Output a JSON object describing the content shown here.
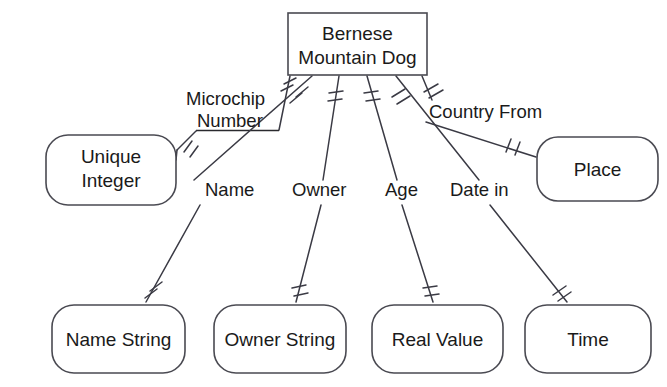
{
  "diagram": {
    "notation": "crow's-foot / Barker ER",
    "background_color": "#ffffff",
    "line_color": "#3a3a44",
    "box_stroke_color": "#4a4a52",
    "text_color": "#1a1a1a"
  },
  "entity": {
    "name": "entity-bernese",
    "line1": "Bernese",
    "line2": "Mountain Dog",
    "shape": "rectangle",
    "x": 288,
    "y": 13,
    "width": 139,
    "height": 62
  },
  "value_boxes": [
    {
      "name": "unique-integer",
      "line1": "Unique",
      "line2": "Integer",
      "shape": "rounded-rectangle",
      "x": 46,
      "y": 135,
      "width": 130,
      "height": 70
    },
    {
      "name": "place",
      "line1": "Place",
      "line2": "",
      "shape": "rounded-rectangle",
      "x": 537,
      "y": 137,
      "width": 121,
      "height": 64
    },
    {
      "name": "name-string",
      "line1": "Name String",
      "line2": "",
      "shape": "rounded-rectangle",
      "x": 52,
      "y": 305,
      "width": 133,
      "height": 68
    },
    {
      "name": "owner-string",
      "line1": "Owner String",
      "line2": "",
      "shape": "rounded-rectangle",
      "x": 214,
      "y": 305,
      "width": 132,
      "height": 68
    },
    {
      "name": "real-value",
      "line1": "Real Value",
      "line2": "",
      "shape": "rounded-rectangle",
      "x": 372,
      "y": 305,
      "width": 131,
      "height": 68
    },
    {
      "name": "time",
      "line1": "Time",
      "line2": "",
      "shape": "rounded-rectangle",
      "x": 525,
      "y": 305,
      "width": 126,
      "height": 68
    }
  ],
  "relationships": [
    {
      "name": "microchip-number",
      "label_line1": "Microchip",
      "label_line2": "Number",
      "underlined": true,
      "from": "entity-bernese",
      "to": "unique-integer"
    },
    {
      "name": "name",
      "label_line1": "Name",
      "label_line2": "",
      "underlined": false,
      "from": "entity-bernese",
      "to": "name-string"
    },
    {
      "name": "owner",
      "label_line1": "Owner",
      "label_line2": "",
      "underlined": false,
      "from": "entity-bernese",
      "to": "owner-string"
    },
    {
      "name": "age",
      "label_line1": "Age",
      "label_line2": "",
      "underlined": false,
      "from": "entity-bernese",
      "to": "real-value"
    },
    {
      "name": "date-in",
      "label_line1": "Date in",
      "label_line2": "",
      "underlined": false,
      "from": "entity-bernese",
      "to": "time"
    },
    {
      "name": "country-from",
      "label_line1": "Country From",
      "label_line2": "",
      "underlined": false,
      "from": "entity-bernese",
      "to": "place"
    }
  ],
  "labels": {
    "entity_line1": "Bernese",
    "entity_line2": "Mountain Dog",
    "microchip_1": "Microchip",
    "microchip_2": "Number",
    "unique_1": "Unique",
    "unique_2": "Integer",
    "place": "Place",
    "country_from": "Country From",
    "name": "Name",
    "owner": "Owner",
    "age": "Age",
    "date_in": "Date in",
    "name_string": "Name String",
    "owner_string": "Owner String",
    "real_value": "Real Value",
    "time": "Time"
  }
}
